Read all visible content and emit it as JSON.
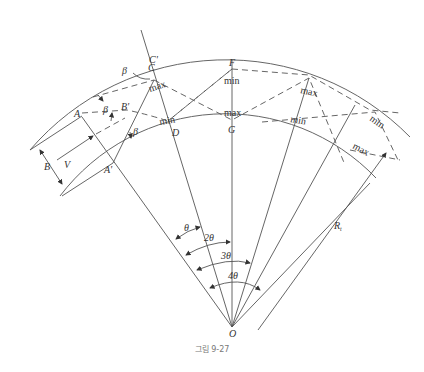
{
  "figure": {
    "caption": "그림 9-27",
    "center_label": "O",
    "points": {
      "A": "A",
      "A_prime": "A'",
      "B_prime": "B'",
      "C": "C",
      "C_prime": "C'",
      "D": "D",
      "F": "F",
      "G": "G"
    },
    "dimensions": {
      "width": "B",
      "velocity": "V",
      "radius": "R",
      "radius_sub": "t"
    },
    "angles": {
      "beta": "β",
      "theta1": "θ",
      "theta2": "2θ",
      "theta3": "3θ",
      "theta4": "4θ"
    },
    "markers": {
      "max_C": "max",
      "min_D": "min",
      "min_F": "min",
      "max_G": "max",
      "max_r1": "max",
      "min_r1": "min",
      "min_r2": "min",
      "max_r2": "max"
    }
  }
}
